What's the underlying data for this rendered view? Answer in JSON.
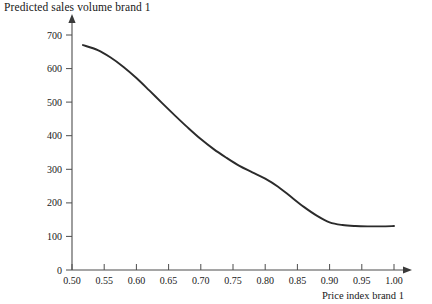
{
  "chart_data": {
    "type": "line",
    "title": "Predicted sales volume brand 1",
    "xlabel": "Price index brand 1",
    "ylabel": "Predicted sales volume brand 1",
    "xlim": [
      0.5,
      1.0
    ],
    "ylim": [
      0,
      700
    ],
    "grid": false,
    "legend": "none",
    "xticks": [
      "0.50",
      "0.55",
      "0.60",
      "0.65",
      "0.70",
      "0.75",
      "0.80",
      "0.85",
      "0.90",
      "0.95",
      "1.00"
    ],
    "xtick_values": [
      0.5,
      0.55,
      0.6,
      0.65,
      0.7,
      0.75,
      0.8,
      0.85,
      0.9,
      0.95,
      1.0
    ],
    "yticks": [
      "0",
      "100",
      "200",
      "300",
      "400",
      "500",
      "600",
      "700"
    ],
    "ytick_values": [
      0,
      100,
      200,
      300,
      400,
      500,
      600,
      700
    ],
    "series": [
      {
        "name": "Predicted sales volume brand 1",
        "x": [
          0.517,
          0.54,
          0.56,
          0.58,
          0.6,
          0.62,
          0.64,
          0.66,
          0.68,
          0.7,
          0.72,
          0.74,
          0.76,
          0.78,
          0.8,
          0.82,
          0.84,
          0.86,
          0.88,
          0.9,
          0.92,
          0.94,
          0.96,
          0.98,
          1.0
        ],
        "y": [
          670,
          655,
          633,
          605,
          572,
          535,
          497,
          460,
          424,
          390,
          360,
          334,
          310,
          291,
          272,
          248,
          218,
          188,
          162,
          142,
          134,
          131,
          130,
          130,
          131
        ],
        "color": "#2b2b2b"
      }
    ],
    "annotations": {
      "x_axis_arrow": true,
      "y_axis_arrow": true,
      "curve_start_value": 670,
      "curve_end_value": 131
    }
  },
  "axes": {
    "x_axis_name": "price-index-axis",
    "y_axis_name": "sales-volume-axis"
  }
}
